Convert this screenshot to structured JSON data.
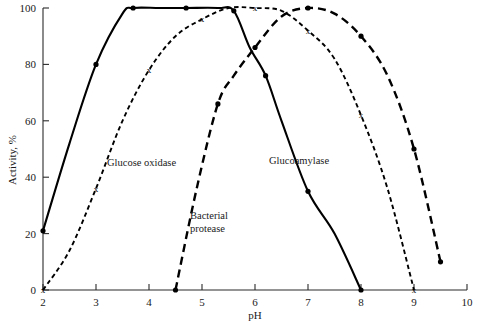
{
  "chart_data": {
    "type": "line",
    "title": "",
    "xlabel": "pH",
    "ylabel": "Activity, %",
    "xlim": [
      2,
      10
    ],
    "ylim": [
      0,
      100
    ],
    "grid": false,
    "legend_position": "inline-annotations",
    "xticks": [
      "2",
      "3",
      "4",
      "5",
      "6",
      "7",
      "8",
      "9",
      "10"
    ],
    "yticks": [
      "0",
      "20",
      "40",
      "60",
      "80",
      "100"
    ],
    "series": [
      {
        "name": "Glucoamylase",
        "style": "solid",
        "marker": "filled-circle",
        "x": [
          2.0,
          2.5,
          3.0,
          3.5,
          3.7,
          4.2,
          4.7,
          5.3,
          5.6,
          5.9,
          6.2,
          6.5,
          7.0,
          7.5,
          8.0
        ],
        "y": [
          21,
          52,
          80,
          98,
          100,
          100,
          100,
          100,
          99,
          86,
          76,
          60,
          35,
          20,
          0
        ]
      },
      {
        "name": "Glucose oxidase",
        "style": "dotted",
        "marker": "x",
        "x": [
          2.0,
          2.5,
          3.0,
          3.5,
          4.0,
          4.5,
          5.0,
          5.5,
          6.0,
          6.5,
          7.0,
          7.5,
          8.0,
          8.5,
          9.0
        ],
        "y": [
          0,
          14,
          36,
          60,
          78,
          90,
          96,
          100,
          100,
          99,
          92,
          82,
          62,
          36,
          0
        ]
      },
      {
        "name": "Bacterial protease",
        "style": "dashed",
        "marker": "filled-circle",
        "x": [
          4.5,
          4.9,
          5.3,
          5.6,
          6.0,
          6.5,
          7.0,
          7.5,
          8.0,
          8.5,
          9.0,
          9.5
        ],
        "y": [
          0,
          36,
          66,
          76,
          86,
          97,
          100,
          98,
          90,
          76,
          50,
          10
        ]
      }
    ]
  },
  "annotations": {
    "glucose_oxidase": "Glucose oxidase",
    "bacterial_protease_line1": "Bacterial",
    "bacterial_protease_line2": "protease",
    "glucoamylase": "Glucoamylase"
  }
}
